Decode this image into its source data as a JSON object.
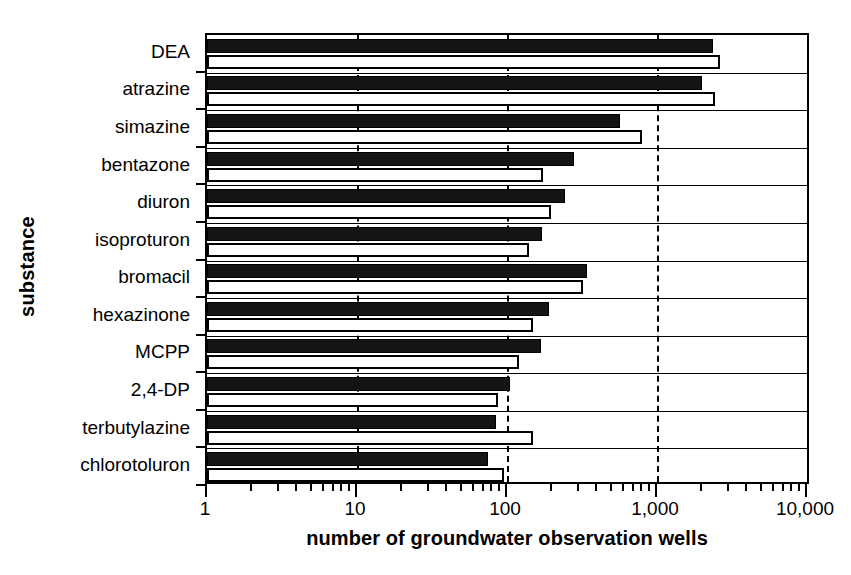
{
  "chart_data": {
    "type": "bar",
    "orientation": "horizontal",
    "title": "",
    "xlabel": "number of groundwater observation wells",
    "ylabel": "substance",
    "xscale": "log",
    "xlim": [
      1,
      10000
    ],
    "grid": "vertical dashed at decades",
    "legend": "none",
    "categories": [
      "DEA",
      "atrazine",
      "simazine",
      "bentazone",
      "diuron",
      "isoproturon",
      "bromacil",
      "hexazinone",
      "MCPP",
      "2,4-DP",
      "terbutylazine",
      "chlorotoluron"
    ],
    "series": [
      {
        "name": "filled",
        "style": "solid-black",
        "values": [
          2350,
          2000,
          570,
          280,
          245,
          170,
          340,
          190,
          168,
          105,
          85,
          75
        ]
      },
      {
        "name": "open",
        "style": "white-outlined",
        "values": [
          2650,
          2450,
          790,
          175,
          195,
          140,
          320,
          150,
          120,
          87,
          150,
          95
        ]
      }
    ],
    "x_tick_labels": [
      "1",
      "10",
      "100",
      "1,000",
      "10,000"
    ],
    "x_tick_values": [
      1,
      10,
      100,
      1000,
      10000
    ]
  },
  "colors": {
    "axis": "#000000",
    "filled_bar": "#141414",
    "open_bar_fill": "#ffffff",
    "open_bar_border": "#000000",
    "gridline": "#000000",
    "background": "#ffffff"
  }
}
